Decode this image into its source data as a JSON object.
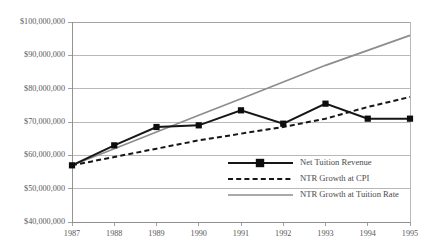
{
  "chart_data": {
    "type": "line",
    "title": "",
    "subtitle": "",
    "xlabel": "",
    "ylabel": "",
    "x": [
      1987,
      1988,
      1989,
      1990,
      1991,
      1992,
      1993,
      1994,
      1995
    ],
    "categories": [
      "1987",
      "1988",
      "1989",
      "1990",
      "1991",
      "1992",
      "1993",
      "1994",
      "1995"
    ],
    "xtick_labels": [
      "1987",
      "1988",
      "1989",
      "1990",
      "1991",
      "1992",
      "1993",
      "1994",
      "1995"
    ],
    "ytick_labels": [
      "$100,000,000",
      "$90,000,000",
      "$80,000,000",
      "$70,000,000",
      "$60,000,000",
      "$50,000,000",
      "$40,000,000"
    ],
    "ytick_values": [
      100000000,
      90000000,
      80000000,
      70000000,
      60000000,
      50000000,
      40000000
    ],
    "ylim": [
      40000000,
      100000000
    ],
    "xlim": [
      1987,
      1995
    ],
    "grid": true,
    "legend_position": "bottom-right-inside",
    "series": [
      {
        "name": "Net Tuition Revenue",
        "style": "solid",
        "color": "#161616",
        "marker": "square",
        "values": [
          57000000,
          63000000,
          68500000,
          69000000,
          73500000,
          69500000,
          75500000,
          71000000,
          71000000
        ]
      },
      {
        "name": "NTR Growth at CPI",
        "style": "dashed",
        "color": "#161616",
        "marker": "none",
        "values": [
          57000000,
          59500000,
          62000000,
          64500000,
          66500000,
          68500000,
          71000000,
          74500000,
          77500000
        ]
      },
      {
        "name": "NTR Growth at Tuition Rate",
        "style": "solid",
        "color": "#8d8d8d",
        "marker": "none",
        "values": [
          57000000,
          62000000,
          67000000,
          72000000,
          77000000,
          82000000,
          87000000,
          91500000,
          96000000
        ]
      }
    ]
  },
  "legend": {
    "items": [
      {
        "label": "Net Tuition Revenue"
      },
      {
        "label": "NTR Growth at CPI"
      },
      {
        "label": "NTR Growth at Tuition Rate"
      }
    ]
  },
  "colors": {
    "series_black": "#161616",
    "series_gray": "#8d8d8d",
    "gridline": "#9a9a9a",
    "text": "#5a5a5a",
    "background": "#ffffff"
  }
}
